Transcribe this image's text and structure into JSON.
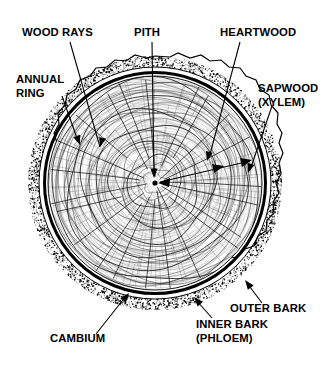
{
  "figure": {
    "background_color": "#ffffff",
    "ink_color": "#000000",
    "width": 333,
    "height": 370
  },
  "labels": [
    {
      "id": "wood-rays",
      "text": "WOOD RAYS",
      "lines": [
        "WOOD RAYS"
      ],
      "text_x": 22,
      "text_y": 36,
      "anchor": "start",
      "leader": {
        "x1": 70,
        "y1": 42,
        "x2": 100,
        "y2": 147
      },
      "arrow": {
        "x": 100,
        "y": 147,
        "angle": 106
      }
    },
    {
      "id": "pith",
      "text": "PITH",
      "lines": [
        "PITH"
      ],
      "text_x": 134,
      "text_y": 36,
      "anchor": "start",
      "leader": {
        "x1": 152,
        "y1": 42,
        "x2": 154,
        "y2": 176
      },
      "arrow": {
        "x": 154,
        "y": 178,
        "angle": 90
      }
    },
    {
      "id": "heartwood",
      "text": "HEARTWOOD",
      "lines": [
        "HEARTWOOD"
      ],
      "text_x": 220,
      "text_y": 36,
      "anchor": "start",
      "leader": {
        "x1": 240,
        "y1": 42,
        "x2": 209,
        "y2": 158
      },
      "arrow": {
        "x": 207,
        "y": 161,
        "angle": 105
      }
    },
    {
      "id": "annual-ring",
      "lines": [
        "ANNUAL",
        "RING"
      ],
      "text": "ANNUAL RING",
      "text_x": 16,
      "text_y": 83,
      "anchor": "start",
      "leader": {
        "x1": 62,
        "y1": 96,
        "x2": 78,
        "y2": 141
      },
      "arrow": {
        "x": 80,
        "y": 145,
        "angle": 70
      }
    },
    {
      "id": "sapwood-xylem",
      "lines": [
        "SAPWOOD",
        "(XYLEM)"
      ],
      "text": "SAPWOOD (XYLEM)",
      "text_x": 258,
      "text_y": 92,
      "anchor": "start",
      "leader": {
        "x1": 272,
        "y1": 106,
        "x2": 250,
        "y2": 170
      },
      "arrow": {
        "x": 248,
        "y": 173,
        "angle": 108
      }
    },
    {
      "id": "outer-bark",
      "text": "OUTER BARK",
      "lines": [
        "OUTER BARK"
      ],
      "text_x": 230,
      "text_y": 312,
      "anchor": "start",
      "leader": {
        "x1": 262,
        "y1": 303,
        "x2": 247,
        "y2": 283
      },
      "arrow": {
        "x": 245,
        "y": 280,
        "angle": 233
      }
    },
    {
      "id": "inner-bark-phloem",
      "lines": [
        "INNER BARK",
        "(PHLOEM)"
      ],
      "text": "INNER BARK (PHLOEM)",
      "text_x": 196,
      "text_y": 328,
      "anchor": "start",
      "leader": {
        "x1": 212,
        "y1": 318,
        "x2": 196,
        "y2": 300
      },
      "arrow": {
        "x": 194,
        "y": 297,
        "angle": 228
      }
    },
    {
      "id": "cambium",
      "text": "CAMBIUM",
      "lines": [
        "CAMBIUM"
      ],
      "text_x": 50,
      "text_y": 342,
      "anchor": "start",
      "leader": {
        "x1": 96,
        "y1": 334,
        "x2": 126,
        "y2": 296
      },
      "arrow": {
        "x": 129,
        "y": 293,
        "angle": 308
      }
    }
  ],
  "trunk": {
    "center_x": 155,
    "center_y": 183,
    "outer_bark_radius": 127,
    "inner_bark_radius": 116,
    "cambium_radius": 110,
    "wood_radius": 107,
    "pith_radius": 3,
    "ring_count": 26,
    "ray_count": 22
  },
  "annotations": {
    "heartwood_span": {
      "description": "double-headed arrow from pith to sapwood boundary",
      "from_x": 158,
      "from_y": 183,
      "to_x": 252,
      "to_y": 160
    }
  }
}
